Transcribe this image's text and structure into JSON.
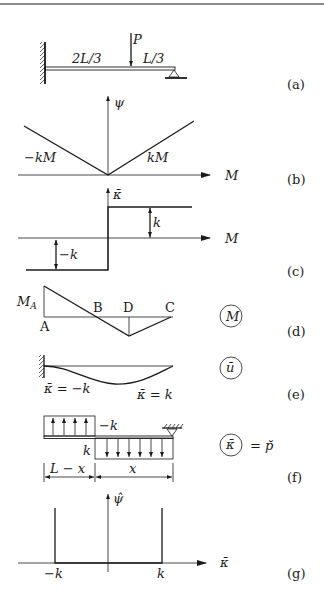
{
  "figure": {
    "panels": {
      "a": {
        "tag": "(a)",
        "segment_left": "2L/3",
        "segment_right": "L/3",
        "load": "P"
      },
      "b": {
        "tag": "(b)",
        "y_axis": "ψ",
        "x_axis": "M",
        "left_branch": "−kM",
        "right_branch": "kM"
      },
      "c": {
        "tag": "(c)",
        "y_axis": "κ̄",
        "x_axis": "M",
        "upper": "k",
        "lower": "−k"
      },
      "d": {
        "tag": "(d)",
        "moment_label": "M_A",
        "moment_label_main": "M",
        "moment_label_sub": "A",
        "points": [
          "A",
          "B",
          "D",
          "C"
        ],
        "circled": "M"
      },
      "e": {
        "tag": "(e)",
        "left_label": "κ̄ = −k",
        "right_label": "κ̄ = k",
        "circled": "ū"
      },
      "f": {
        "tag": "(f)",
        "upper_load": "−k",
        "lower_load": "k",
        "dim_left": "L − x",
        "dim_right": "x",
        "circled": "κ̄",
        "equals": "= p̆"
      },
      "g": {
        "tag": "(g)",
        "y_axis": "ψ̂",
        "x_axis": "κ̄",
        "left_tick": "−k",
        "right_tick": "k"
      }
    }
  }
}
